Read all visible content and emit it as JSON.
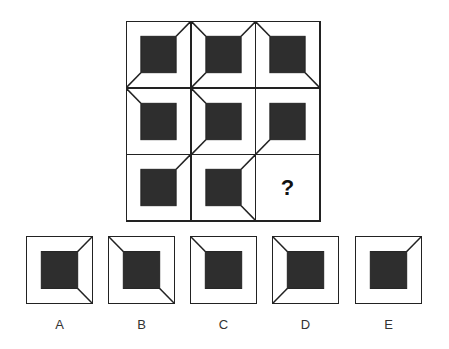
{
  "puzzle": {
    "grid": [
      [
        {
          "lines": [
            "tr",
            "bl"
          ]
        },
        {
          "lines": [
            "tl",
            "tr",
            "bl"
          ]
        },
        {
          "lines": [
            "tl",
            "br"
          ]
        }
      ],
      [
        {
          "lines": [
            "tl"
          ]
        },
        {
          "lines": [
            "tl",
            "bl"
          ]
        },
        {
          "lines": [
            "bl"
          ]
        }
      ],
      [
        {
          "lines": [
            "tr"
          ]
        },
        {
          "lines": [
            "tr",
            "br"
          ]
        },
        {
          "missing": true,
          "text": "?"
        }
      ]
    ],
    "question_mark": "?",
    "options": [
      {
        "label": "A",
        "lines": [
          "tr",
          "br"
        ]
      },
      {
        "label": "B",
        "lines": [
          "tl",
          "br"
        ]
      },
      {
        "label": "C",
        "lines": [
          "tl"
        ]
      },
      {
        "label": "D",
        "lines": [
          "tl",
          "bl"
        ]
      },
      {
        "label": "E",
        "lines": [
          "tr"
        ]
      }
    ],
    "colors": {
      "inner_square": "#2e2e2e",
      "stroke": "#222222"
    }
  }
}
